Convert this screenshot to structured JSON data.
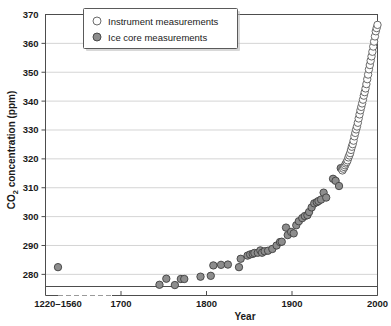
{
  "chart_data": {
    "type": "scatter",
    "title": "",
    "subtitle": "",
    "xlabel": "Year",
    "ylabel": "CO₂ concentration (ppm)",
    "ylabel_plain": "CO2 concentration (ppm)",
    "xlim": [
      1600,
      2010
    ],
    "ylim": [
      275.8,
      370
    ],
    "grid": true,
    "grid_axis": "y",
    "legend_position": "top-left-inside",
    "x_tick_labels": [
      "1220–1560",
      "1700",
      "1800",
      "1900",
      "2000"
    ],
    "x_tick_values": [
      1640,
      1700,
      1800,
      1900,
      2000
    ],
    "y_tick_labels": [
      "280",
      "290",
      "300",
      "310",
      "320",
      "330",
      "340",
      "350",
      "360",
      "370"
    ],
    "y_tick_values": [
      280,
      290,
      300,
      310,
      320,
      330,
      340,
      350,
      360,
      370
    ],
    "axis_break": {
      "present": true,
      "style": "dashed",
      "between": [
        "1220–1560",
        "1700"
      ],
      "note": "x axis compressed / broken between the 1220–1560 block and 1700"
    },
    "colors": {
      "ice_core_fill": "#8d8d8d",
      "ice_core_stroke": "#3f3f3f",
      "instrument_fill": "#fdfdfd",
      "instrument_stroke": "#5a5a5a",
      "grid": "#c9c9c9",
      "frame": "#4d4d4d",
      "background": "#ffffff"
    },
    "series": [
      {
        "name": "Instrument measurements",
        "marker": "open-circle",
        "points": [
          [
            1959,
            316.0
          ],
          [
            1960,
            316.6
          ],
          [
            1961,
            317.2
          ],
          [
            1962,
            317.8
          ],
          [
            1963,
            318.4
          ],
          [
            1964,
            318.9
          ],
          [
            1965,
            319.5
          ],
          [
            1966,
            320.5
          ],
          [
            1967,
            321.2
          ],
          [
            1968,
            322.0
          ],
          [
            1969,
            323.1
          ],
          [
            1970,
            324.2
          ],
          [
            1971,
            325.1
          ],
          [
            1972,
            326.3
          ],
          [
            1973,
            327.8
          ],
          [
            1974,
            329.0
          ],
          [
            1975,
            330.2
          ],
          [
            1976,
            331.2
          ],
          [
            1977,
            332.5
          ],
          [
            1978,
            334.0
          ],
          [
            1979,
            335.4
          ],
          [
            1980,
            336.8
          ],
          [
            1981,
            338.0
          ],
          [
            1982,
            339.2
          ],
          [
            1983,
            340.5
          ],
          [
            1984,
            341.9
          ],
          [
            1985,
            343.1
          ],
          [
            1986,
            344.4
          ],
          [
            1987,
            345.9
          ],
          [
            1988,
            347.6
          ],
          [
            1989,
            349.2
          ],
          [
            1990,
            351.0
          ],
          [
            1991,
            352.5
          ],
          [
            1992,
            354.0
          ],
          [
            1993,
            355.5
          ],
          [
            1994,
            357.1
          ],
          [
            1995,
            358.9
          ],
          [
            1996,
            360.6
          ],
          [
            1997,
            362.4
          ],
          [
            1998,
            364.2
          ],
          [
            1999,
            365.3
          ],
          [
            2000,
            366.4
          ]
        ]
      },
      {
        "name": "Ice core measurements",
        "marker": "filled-circle",
        "points": [
          [
            1640,
            282.5
          ],
          [
            1745,
            276.4
          ],
          [
            1753,
            278.5
          ],
          [
            1763,
            276.3
          ],
          [
            1770,
            278.4
          ],
          [
            1774,
            278.4
          ],
          [
            1793,
            279.2
          ],
          [
            1805,
            279.5
          ],
          [
            1808,
            283.1
          ],
          [
            1817,
            283.3
          ],
          [
            1825,
            283.4
          ],
          [
            1838,
            282.5
          ],
          [
            1840,
            285.4
          ],
          [
            1848,
            286.5
          ],
          [
            1851,
            286.9
          ],
          [
            1854,
            287.1
          ],
          [
            1856,
            287.4
          ],
          [
            1860,
            287.5
          ],
          [
            1863,
            288.3
          ],
          [
            1865,
            287.5
          ],
          [
            1868,
            288.0
          ],
          [
            1872,
            288.2
          ],
          [
            1877,
            288.8
          ],
          [
            1882,
            290.0
          ],
          [
            1886,
            291.2
          ],
          [
            1888,
            291.3
          ],
          [
            1893,
            296.2
          ],
          [
            1895,
            293.6
          ],
          [
            1899,
            294.7
          ],
          [
            1902,
            294.2
          ],
          [
            1905,
            297.0
          ],
          [
            1908,
            298.4
          ],
          [
            1912,
            299.5
          ],
          [
            1915,
            300.2
          ],
          [
            1918,
            300.5
          ],
          [
            1920,
            301.6
          ],
          [
            1923,
            303.2
          ],
          [
            1926,
            304.6
          ],
          [
            1929,
            305.0
          ],
          [
            1931,
            305.4
          ],
          [
            1934,
            305.9
          ],
          [
            1937,
            308.3
          ],
          [
            1940,
            306.6
          ],
          [
            1948,
            313.1
          ],
          [
            1951,
            312.4
          ],
          [
            1955,
            310.6
          ],
          [
            1957,
            316.8
          ],
          [
            1959,
            316.2
          ],
          [
            1961,
            317.0
          ]
        ]
      }
    ],
    "legend": [
      {
        "label": "Instrument measurements",
        "marker": "open-circle"
      },
      {
        "label": "Ice core measurements",
        "marker": "filled-circle"
      }
    ]
  }
}
